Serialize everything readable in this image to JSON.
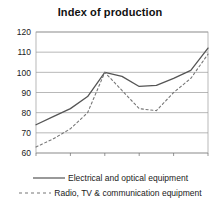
{
  "chart_data": {
    "type": "line",
    "title": "Index of production",
    "xlabel": "",
    "ylabel": "",
    "x": [
      1996,
      1997,
      1998,
      1999,
      2000,
      2001,
      2002,
      2003,
      2004,
      2005,
      2006
    ],
    "xlim": [
      1996,
      2006
    ],
    "ylim": [
      60,
      120
    ],
    "xticks": [
      1996,
      1998,
      2000,
      2002,
      2004,
      2006
    ],
    "xtick_labels": [
      "1996",
      "1998",
      "2000",
      "2002",
      "2004",
      "2006"
    ],
    "yticks": [
      60,
      70,
      80,
      90,
      100,
      110,
      120
    ],
    "ytick_labels": [
      "60",
      "70",
      "80",
      "90",
      "100",
      "110",
      "120"
    ],
    "grid": true,
    "grid_axis": "y",
    "legend_position": "bottom",
    "series": [
      {
        "name": "Electrical and optical equipment",
        "style": "solid",
        "color": "#555555",
        "values": [
          74,
          78,
          82,
          88,
          100,
          98,
          93,
          93.5,
          97,
          101,
          112
        ]
      },
      {
        "name": "Radio, TV & communication equipment",
        "style": "dashed",
        "color": "#777777",
        "values": [
          63,
          67,
          72,
          80,
          100,
          91,
          82,
          81,
          90,
          97,
          109
        ]
      }
    ]
  },
  "legend": {
    "items": [
      {
        "label": "Electrical and optical equipment",
        "style": "solid"
      },
      {
        "label": "Radio, TV & communication equipment",
        "style": "dashed"
      }
    ]
  }
}
